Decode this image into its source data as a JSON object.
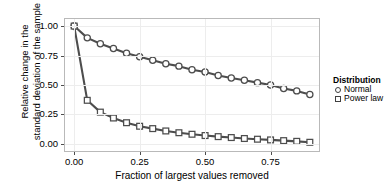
{
  "chart_data": {
    "type": "line",
    "title": "",
    "xlabel": "Fraction of largest values removed",
    "ylabel_line1": "Relative change in the",
    "ylabel_line2": "standard deviation of the sample",
    "xlim": [
      -0.035,
      0.935
    ],
    "ylim": [
      -0.06,
      1.06
    ],
    "xticks": [
      0.0,
      0.25,
      0.5,
      0.75
    ],
    "xticklabels": [
      "0.00",
      "0.25",
      "0.50",
      "0.75"
    ],
    "yticks": [
      0.0,
      0.25,
      0.5,
      0.75,
      1.0
    ],
    "yticklabels": [
      "0.00",
      "0.25",
      "0.50",
      "0.75",
      "1.00"
    ],
    "grid": true,
    "legend_position": "right",
    "legend_title": "Distribution",
    "x": [
      0.0,
      0.05,
      0.1,
      0.15,
      0.2,
      0.25,
      0.3,
      0.35,
      0.4,
      0.45,
      0.5,
      0.55,
      0.6,
      0.65,
      0.7,
      0.75,
      0.8,
      0.85,
      0.9
    ],
    "series": [
      {
        "name": "Normal",
        "marker": "circle",
        "color": "#4d4d4d",
        "values": [
          1.0,
          0.9,
          0.85,
          0.81,
          0.77,
          0.74,
          0.71,
          0.68,
          0.66,
          0.63,
          0.61,
          0.58,
          0.56,
          0.54,
          0.52,
          0.5,
          0.47,
          0.45,
          0.42
        ]
      },
      {
        "name": "Power law",
        "marker": "square",
        "color": "#4d4d4d",
        "values": [
          1.0,
          0.37,
          0.27,
          0.22,
          0.18,
          0.15,
          0.13,
          0.11,
          0.095,
          0.082,
          0.071,
          0.062,
          0.054,
          0.046,
          0.04,
          0.034,
          0.028,
          0.022,
          0.014
        ]
      }
    ]
  },
  "axes": {
    "y_title_line1": "Relative change in the",
    "y_title_line2": "standard deviation of the sample",
    "x_title": "Fraction of largest values removed"
  },
  "legend": {
    "title": "Distribution",
    "items": [
      {
        "label": "Normal",
        "marker": "circle-marker-icon"
      },
      {
        "label": "Power law",
        "marker": "square-marker-icon"
      }
    ]
  }
}
